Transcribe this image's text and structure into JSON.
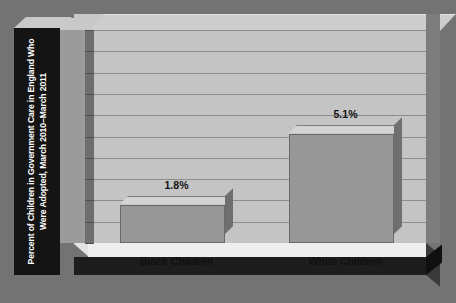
{
  "chart_data": {
    "type": "bar",
    "title": "",
    "xlabel": "",
    "ylabel": "Percent of Children in Government Care in England Who Were Adopted, March 2010–March 2011",
    "categories": [
      "Black Children",
      "White Children"
    ],
    "values": [
      1.8,
      5.1
    ],
    "value_labels": [
      "1.8%",
      "5.1%"
    ],
    "ylim": [
      0,
      10
    ],
    "ytick_labels": [
      "10",
      "9",
      "8",
      "7",
      "6",
      "5",
      "4",
      "3",
      "2",
      "1",
      "0"
    ],
    "ytick_values": [
      10,
      9,
      8,
      7,
      6,
      5,
      4,
      3,
      2,
      1,
      0
    ],
    "grid": true,
    "legend": "none",
    "units": "percent",
    "style": "3d-bar"
  },
  "colors": {
    "page_background": "#737373",
    "plot_wall": "#c4c4c4",
    "gridline": "#8d8d8d",
    "bar_face": "#979797",
    "bar_top": "#d3d3d3",
    "bar_side": "#6f6f6f",
    "axis_strip": "#9b9b9b",
    "title_block": "#141414",
    "title_text": "#ffffff",
    "floor": "#eeeeee",
    "floor_front": "#1d1d1d",
    "label_text": "#111111"
  }
}
